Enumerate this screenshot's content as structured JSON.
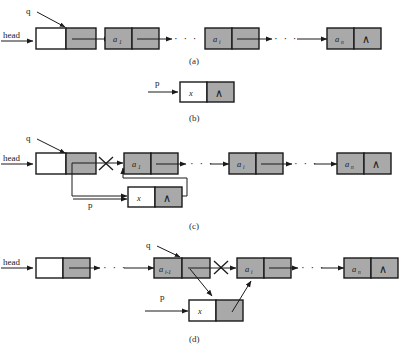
{
  "figure": {
    "background_color": "#ffffff",
    "node_fill_gray": "#a9a9a9",
    "node_fill_white": "#ffffff",
    "stroke_color": "#1a1a1a",
    "null_symbol": "∧",
    "ellipsis": "· · ·"
  },
  "panels": [
    {
      "id": "a",
      "caption": "(a)",
      "labels": {
        "head": "head",
        "q": "q"
      },
      "nodes": [
        {
          "name": "head-node",
          "data": "",
          "filled": false,
          "link": "pointer"
        },
        {
          "name": "node-a1",
          "data": "a",
          "subscript": "1",
          "filled": true,
          "link": "pointer"
        },
        {
          "name": "node-ai",
          "data": "a",
          "subscript": "i",
          "filled": true,
          "link": "pointer"
        },
        {
          "name": "node-an",
          "data": "a",
          "subscript": "n",
          "filled": true,
          "link": "null"
        }
      ]
    },
    {
      "id": "b",
      "caption": "(b)",
      "labels": {
        "p": "p"
      },
      "nodes": [
        {
          "name": "node-x",
          "data": "x",
          "filled": false,
          "link": "null"
        }
      ]
    },
    {
      "id": "c",
      "caption": "(c)",
      "labels": {
        "head": "head",
        "q": "q",
        "p": "p"
      },
      "nodes": [
        {
          "name": "head-node",
          "data": "",
          "filled": false,
          "link": "redirected"
        },
        {
          "name": "node-a1",
          "data": "a",
          "subscript": "1",
          "filled": true,
          "link": "pointer"
        },
        {
          "name": "node-ai",
          "data": "a",
          "subscript": "i",
          "filled": true,
          "link": "pointer"
        },
        {
          "name": "node-an",
          "data": "a",
          "subscript": "n",
          "filled": true,
          "link": "null"
        },
        {
          "name": "node-x",
          "data": "x",
          "filled": false,
          "link": "null"
        }
      ],
      "broken_link": true
    },
    {
      "id": "d",
      "caption": "(d)",
      "labels": {
        "head": "head",
        "q": "q",
        "p": "p"
      },
      "nodes": [
        {
          "name": "head-node",
          "data": "",
          "filled": false,
          "link": "pointer"
        },
        {
          "name": "node-ai-1",
          "data": "a",
          "subscript": "i-1",
          "filled": true,
          "link": "redirected"
        },
        {
          "name": "node-ai",
          "data": "a",
          "subscript": "i",
          "filled": true,
          "link": "pointer"
        },
        {
          "name": "node-an",
          "data": "a",
          "subscript": "n",
          "filled": true,
          "link": "null"
        },
        {
          "name": "node-x",
          "data": "x",
          "filled": false,
          "link": "pointer"
        }
      ],
      "broken_link": true
    }
  ]
}
